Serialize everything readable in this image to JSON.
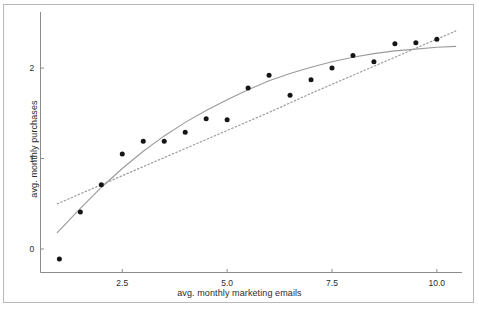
{
  "figure": {
    "background_color": "#ffffff",
    "frame_color": "#b9b9b9",
    "axis_color": "#8c8c8c",
    "point_color": "#151515",
    "solid_line_color": "#9a9a9a",
    "dotted_line_color": "#9a9a9a",
    "text_color": "#2b2b2b"
  },
  "chart_data": {
    "type": "scatter",
    "title": "",
    "xlabel": "avg. monthly marketing emails",
    "ylabel": "avg. monthly purchases",
    "xlim": [
      0.55,
      10.6
    ],
    "ylim": [
      -0.26,
      2.62
    ],
    "xticks": [
      2.5,
      5.0,
      7.5,
      10.0
    ],
    "xtick_labels": [
      "2.5",
      "5.0",
      "7.5",
      "10.0"
    ],
    "yticks": [
      0,
      1,
      2
    ],
    "ytick_labels": [
      "0",
      "1",
      "2"
    ],
    "grid": false,
    "legend": null,
    "x": [
      1.0,
      1.5,
      2.0,
      2.5,
      3.0,
      3.5,
      4.0,
      4.5,
      5.0,
      5.5,
      6.0,
      6.5,
      7.0,
      7.5,
      8.0,
      8.5,
      9.0,
      9.5,
      10.0
    ],
    "values": [
      -0.11,
      0.41,
      0.71,
      1.05,
      1.19,
      1.19,
      1.29,
      1.44,
      1.43,
      1.78,
      1.92,
      1.7,
      1.87,
      2.0,
      2.14,
      2.07,
      2.27,
      2.28,
      2.32
    ],
    "series": [
      {
        "name": "observed points",
        "style": "marker",
        "x": [
          1.0,
          1.5,
          2.0,
          2.5,
          3.0,
          3.5,
          4.0,
          4.5,
          5.0,
          5.5,
          6.0,
          6.5,
          7.0,
          7.5,
          8.0,
          8.5,
          9.0,
          9.5,
          10.0
        ],
        "values": [
          -0.11,
          0.41,
          0.71,
          1.05,
          1.19,
          1.19,
          1.29,
          1.44,
          1.43,
          1.78,
          1.92,
          1.7,
          1.87,
          2.0,
          2.14,
          2.07,
          2.27,
          2.28,
          2.32
        ]
      },
      {
        "name": "solid fitted curve",
        "style": "solid-line",
        "x": [
          0.95,
          1.5,
          2.0,
          2.5,
          3.0,
          3.5,
          4.0,
          4.5,
          5.0,
          5.5,
          6.0,
          6.5,
          7.0,
          7.5,
          8.0,
          8.5,
          9.0,
          9.5,
          10.0,
          10.45
        ],
        "values": [
          0.18,
          0.45,
          0.68,
          0.89,
          1.08,
          1.25,
          1.4,
          1.53,
          1.65,
          1.76,
          1.86,
          1.94,
          2.01,
          2.07,
          2.12,
          2.16,
          2.19,
          2.21,
          2.23,
          2.24
        ]
      },
      {
        "name": "dotted fitted line",
        "style": "dotted-line",
        "x": [
          0.95,
          2.0,
          3.0,
          4.0,
          5.0,
          6.0,
          7.0,
          8.0,
          9.0,
          10.0,
          10.45
        ],
        "values": [
          0.5,
          0.71,
          0.91,
          1.11,
          1.31,
          1.51,
          1.72,
          1.92,
          2.12,
          2.32,
          2.41
        ]
      }
    ]
  }
}
